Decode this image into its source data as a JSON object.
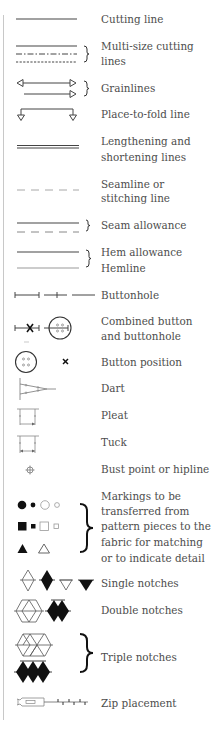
{
  "legend": {
    "title": "Pattern markings",
    "items": [
      {
        "id": "cutting-line",
        "icon": "solid-line-icon",
        "lines": [
          "Cutting line"
        ]
      },
      {
        "id": "multi-size-cutting-lines",
        "icon": "multi-size-lines-icon",
        "lines": [
          "Multi-size cutting",
          "lines"
        ]
      },
      {
        "id": "grainlines",
        "icon": "grainline-arrows-icon",
        "lines": [
          "Grainlines"
        ]
      },
      {
        "id": "place-to-fold-line",
        "icon": "fold-line-icon",
        "lines": [
          "Place-to-fold line"
        ]
      },
      {
        "id": "lengthening-shortening-lines",
        "icon": "double-line-icon",
        "lines": [
          "Lengthening and",
          "shortening lines"
        ]
      },
      {
        "id": "seamline",
        "icon": "dashed-line-icon",
        "lines": [
          "Seamline or",
          "stitching line"
        ]
      },
      {
        "id": "seam-allowance",
        "icon": "seam-allowance-icon",
        "lines": [
          "Seam allowance"
        ]
      },
      {
        "id": "hem-allowance-hemline",
        "icon": "hem-lines-icon",
        "lines": [
          "Hem allowance",
          "Hemline"
        ]
      },
      {
        "id": "buttonhole",
        "icon": "buttonhole-icon",
        "lines": [
          "Buttonhole"
        ]
      },
      {
        "id": "combined-button-buttonhole",
        "icon": "combined-button-icon",
        "lines": [
          "Combined button",
          "and buttonhole"
        ]
      },
      {
        "id": "button-position",
        "icon": "button-position-icon",
        "lines": [
          "Button position"
        ]
      },
      {
        "id": "dart",
        "icon": "dart-icon",
        "lines": [
          "Dart"
        ]
      },
      {
        "id": "pleat",
        "icon": "pleat-icon",
        "lines": [
          "Pleat"
        ]
      },
      {
        "id": "tuck",
        "icon": "tuck-icon",
        "lines": [
          "Tuck"
        ]
      },
      {
        "id": "bust-point",
        "icon": "crosshair-icon",
        "lines": [
          "Bust point or hipline"
        ]
      },
      {
        "id": "markings",
        "icon": "shape-markings-icon",
        "lines": [
          "Markings to be",
          "transferred from",
          "pattern pieces to the",
          "fabric for matching",
          "or to indicate detail"
        ]
      },
      {
        "id": "single-notches",
        "icon": "single-notch-icon",
        "lines": [
          "Single notches"
        ]
      },
      {
        "id": "double-notches",
        "icon": "double-notch-icon",
        "lines": [
          "Double notches"
        ]
      },
      {
        "id": "triple-notches",
        "icon": "triple-notch-icon",
        "lines": [
          "Triple notches"
        ]
      },
      {
        "id": "zip-placement",
        "icon": "zip-icon",
        "lines": [
          "Zip placement"
        ]
      }
    ],
    "colors": {
      "text": "#4d4d4d",
      "line": "#555555",
      "light_line": "#9a9a9a",
      "rule": "#c8c8c8",
      "fill": "#111111"
    }
  }
}
